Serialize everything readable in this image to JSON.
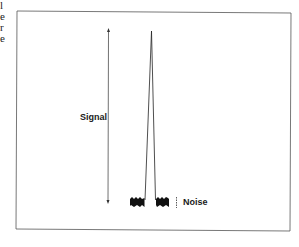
{
  "edge_fragments": [
    "l",
    "e",
    "r",
    "e"
  ],
  "diagram": {
    "signal_label": "Signal",
    "noise_label": "Noise",
    "colors": {
      "line": "#222222",
      "frame": "#555555",
      "noise": "#111111"
    }
  }
}
